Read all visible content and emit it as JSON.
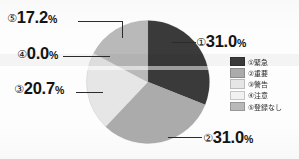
{
  "chart_data": {
    "type": "pie",
    "title": "",
    "subtitle": "",
    "xlabel": "",
    "ylabel": "",
    "legend_position": "right",
    "grid": false,
    "start_angle_deg": 0,
    "direction": "clockwise",
    "categories": [
      "①緊急",
      "②重要",
      "③警告",
      "④注意",
      "⑤登録なし"
    ],
    "values": [
      31.0,
      31.0,
      20.7,
      0.0,
      17.2
    ],
    "value_suffix": "%",
    "colors": [
      "#3a3a3a",
      "#ababab",
      "#e6e6e6",
      "#f1f1f1",
      "#b9b9b9"
    ],
    "slices": [
      {
        "index": "①",
        "label": "①緊急",
        "value": 31.0,
        "display": "31.0%",
        "color": "#3a3a3a"
      },
      {
        "index": "②",
        "label": "②重要",
        "value": 31.0,
        "display": "31.0%",
        "color": "#ababab"
      },
      {
        "index": "③",
        "label": "③警告",
        "value": 20.7,
        "display": "20.7%",
        "color": "#e6e6e6"
      },
      {
        "index": "④",
        "label": "④注意",
        "value": 0.0,
        "display": "0.0%",
        "color": "#f1f1f1"
      },
      {
        "index": "⑤",
        "label": "⑤登録なし",
        "value": 17.2,
        "display": "17.2%",
        "color": "#b9b9b9"
      }
    ]
  },
  "callouts": {
    "one": {
      "index": "①",
      "number": "31.0",
      "percent": "%"
    },
    "two": {
      "index": "②",
      "number": "31.0",
      "percent": "%"
    },
    "three": {
      "index": "③",
      "number": "20.7",
      "percent": "%"
    },
    "four": {
      "index": "④",
      "number": "0.0",
      "percent": "%"
    },
    "five": {
      "index": "⑤",
      "number": "17.2",
      "percent": "%"
    }
  },
  "legend": {
    "items": [
      {
        "label": "①緊急",
        "color": "#3a3a3a"
      },
      {
        "label": "②重要",
        "color": "#ababab"
      },
      {
        "label": "③警告",
        "color": "#e6e6e6"
      },
      {
        "label": "④注意",
        "color": "#f1f1f1"
      },
      {
        "label": "⑤登録なし",
        "color": "#b9b9b9"
      }
    ]
  }
}
